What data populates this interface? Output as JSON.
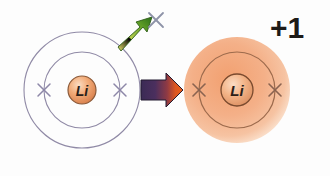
{
  "figure": {
    "background_color": "#fdfdfd",
    "width": 330,
    "height": 176
  },
  "neutral_atom": {
    "name": "Lithium atom",
    "nucleus_label": "Li",
    "nucleus_fill": "#f0a878",
    "nucleus_stroke": "#8a5a3a",
    "center": {
      "x": 82,
      "y": 90
    },
    "shells": [
      {
        "name": "outer-shell",
        "radius": 58,
        "stroke": "#8d87a8",
        "electrons": 1
      },
      {
        "name": "inner-shell",
        "radius": 38,
        "stroke": "#8d87a8",
        "electrons": 2
      }
    ],
    "electron_marks": [
      {
        "x": 44,
        "y": 90,
        "color": "#8d87a8"
      },
      {
        "x": 120,
        "y": 90,
        "color": "#8d87a8"
      }
    ],
    "nucleus_radius": 14
  },
  "ejected_electron": {
    "name": "ejected-electron",
    "symbol": "x",
    "x": 155,
    "y": 20,
    "color": "#8e93a8"
  },
  "electron_arrow": {
    "name": "electron-ejection-arrow",
    "direction": "up-right",
    "gradient_start": "#efe86a",
    "gradient_end": "#2f7a1e"
  },
  "transform_arrow": {
    "name": "transformation-arrow",
    "direction": "right",
    "gradient_start": "#3a2a52",
    "gradient_end": "#e8541b"
  },
  "ion": {
    "name": "Lithium ion",
    "nucleus_label": "Li",
    "charge_label": "+1",
    "nucleus_fill": "#f2b188",
    "nucleus_stroke": "#7a4a2e",
    "glow_fill": "#f3b189",
    "center": {
      "x": 237,
      "y": 90
    },
    "shells": [
      {
        "name": "outer-glow",
        "radius": 53,
        "stroke": "none"
      },
      {
        "name": "inner-shell",
        "radius": 38,
        "stroke": "#9a6a4e",
        "electrons": 2
      }
    ],
    "electron_marks": [
      {
        "x": 199,
        "y": 90,
        "color": "#8a6350"
      },
      {
        "x": 275,
        "y": 90,
        "color": "#8a6350"
      }
    ],
    "nucleus_radius": 16,
    "charge_position": {
      "x": 287,
      "y": 33
    }
  }
}
